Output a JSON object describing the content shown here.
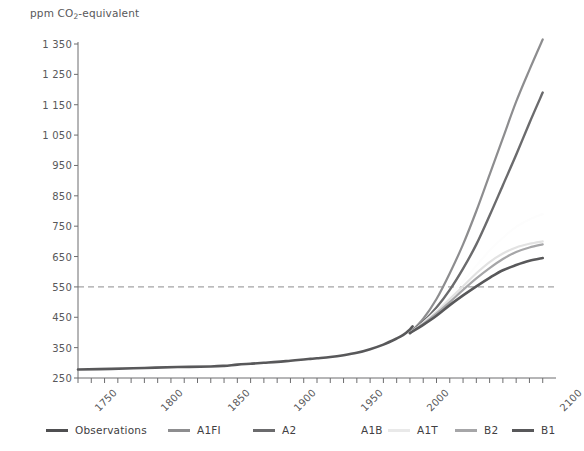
{
  "chart_data": {
    "type": "line",
    "title": "",
    "ylabel": "ppm CO2-equivalent",
    "ylabel_parts": {
      "prefix": "ppm CO",
      "sub": "2",
      "suffix": "-equivalent"
    },
    "xlabel": "",
    "ylim": [
      250,
      1350
    ],
    "xlim": [
      1750,
      2110
    ],
    "ytick_values": [
      250,
      350,
      450,
      550,
      650,
      750,
      850,
      950,
      1050,
      1150,
      1250,
      1350
    ],
    "ytick_labels": [
      "250",
      "350",
      "450",
      "550",
      "650",
      "750",
      "850",
      "950",
      "1 050",
      "1 150",
      "1 250",
      "1 350"
    ],
    "xtick_labels": [
      "1750",
      "1800",
      "1850",
      "1900",
      "1950",
      "2000",
      "2100"
    ],
    "xtick_label_values": [
      1750,
      1800,
      1850,
      1900,
      1950,
      2000,
      2100
    ],
    "xminor_step": 10,
    "grid": false,
    "legend_position": "bottom",
    "reference_line": {
      "y": 550,
      "style": "dashed",
      "color": "#8c8c8e"
    },
    "series": [
      {
        "name": "Observations",
        "color": "#58585a",
        "width": 2.6,
        "points": [
          [
            1750,
            278
          ],
          [
            1775,
            280
          ],
          [
            1800,
            283
          ],
          [
            1825,
            286
          ],
          [
            1850,
            288
          ],
          [
            1860,
            290
          ],
          [
            1870,
            294
          ],
          [
            1880,
            297
          ],
          [
            1890,
            300
          ],
          [
            1900,
            303
          ],
          [
            1910,
            307
          ],
          [
            1920,
            311
          ],
          [
            1925,
            313
          ],
          [
            1930,
            315
          ],
          [
            1940,
            319
          ],
          [
            1950,
            325
          ],
          [
            1960,
            333
          ],
          [
            1970,
            345
          ],
          [
            1980,
            360
          ],
          [
            1990,
            380
          ],
          [
            1995,
            392
          ],
          [
            2000,
            410
          ],
          [
            2002,
            420
          ]
        ]
      },
      {
        "name": "A1FI",
        "color": "#8d8d8f",
        "width": 2.2,
        "points": [
          [
            2000,
            398
          ],
          [
            2010,
            445
          ],
          [
            2020,
            510
          ],
          [
            2030,
            595
          ],
          [
            2040,
            690
          ],
          [
            2050,
            800
          ],
          [
            2060,
            920
          ],
          [
            2070,
            1040
          ],
          [
            2080,
            1160
          ],
          [
            2090,
            1265
          ],
          [
            2100,
            1365
          ]
        ]
      },
      {
        "name": "A2",
        "color": "#6b6b6d",
        "width": 2.4,
        "points": [
          [
            2000,
            398
          ],
          [
            2010,
            435
          ],
          [
            2020,
            482
          ],
          [
            2030,
            540
          ],
          [
            2040,
            610
          ],
          [
            2050,
            690
          ],
          [
            2060,
            785
          ],
          [
            2070,
            885
          ],
          [
            2080,
            985
          ],
          [
            2090,
            1090
          ],
          [
            2100,
            1190
          ]
        ]
      },
      {
        "name": "A1B",
        "color": "#fdfdfd",
        "width": 2.2,
        "points": [
          [
            2000,
            398
          ],
          [
            2010,
            432
          ],
          [
            2020,
            472
          ],
          [
            2030,
            518
          ],
          [
            2040,
            568
          ],
          [
            2050,
            620
          ],
          [
            2060,
            670
          ],
          [
            2070,
            712
          ],
          [
            2080,
            748
          ],
          [
            2090,
            772
          ],
          [
            2100,
            790
          ]
        ]
      },
      {
        "name": "A1T",
        "color": "#e2e2e2",
        "width": 2.2,
        "points": [
          [
            2000,
            398
          ],
          [
            2010,
            430
          ],
          [
            2020,
            468
          ],
          [
            2030,
            510
          ],
          [
            2040,
            552
          ],
          [
            2050,
            595
          ],
          [
            2060,
            632
          ],
          [
            2070,
            660
          ],
          [
            2080,
            680
          ],
          [
            2090,
            692
          ],
          [
            2100,
            700
          ]
        ]
      },
      {
        "name": "B2",
        "color": "#a6a6a8",
        "width": 2.2,
        "points": [
          [
            2000,
            398
          ],
          [
            2010,
            428
          ],
          [
            2020,
            462
          ],
          [
            2030,
            500
          ],
          [
            2040,
            540
          ],
          [
            2050,
            578
          ],
          [
            2060,
            612
          ],
          [
            2070,
            642
          ],
          [
            2080,
            665
          ],
          [
            2090,
            680
          ],
          [
            2100,
            690
          ]
        ]
      },
      {
        "name": "B1",
        "color": "#58585a",
        "width": 2.6,
        "points": [
          [
            2000,
            398
          ],
          [
            2010,
            425
          ],
          [
            2020,
            455
          ],
          [
            2030,
            490
          ],
          [
            2040,
            522
          ],
          [
            2050,
            552
          ],
          [
            2060,
            580
          ],
          [
            2070,
            605
          ],
          [
            2080,
            622
          ],
          [
            2090,
            636
          ],
          [
            2100,
            645
          ]
        ]
      }
    ]
  },
  "legend": {
    "items": [
      {
        "label": "Observations",
        "color": "#4f4f51",
        "swatch_width": 22
      },
      {
        "label": "A1FI",
        "color": "#8d8d8f",
        "swatch_width": 22
      },
      {
        "label": "A2",
        "color": "#6b6b6d",
        "swatch_width": 22
      },
      {
        "label": "A1B",
        "color": "#ffffff",
        "swatch_width": 22
      },
      {
        "label": "A1T",
        "color": "#e9e9e9",
        "swatch_width": 22
      },
      {
        "label": "B2",
        "color": "#a6a6a8",
        "swatch_width": 22
      },
      {
        "label": "B1",
        "color": "#58585a",
        "swatch_width": 22
      }
    ]
  },
  "axis": {
    "line_color": "#6d6d6f",
    "tick_color": "#6d6d6f",
    "text_color": "#58585a"
  }
}
